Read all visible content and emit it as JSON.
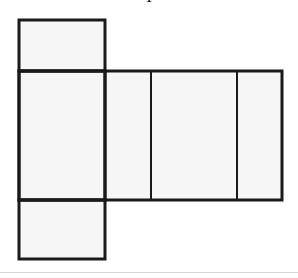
{
  "figure": {
    "kind": "net-diagram",
    "top_label": "I",
    "background_color": "#ffffff",
    "face_fill_color": "#f6f6f6",
    "stroke_color": "#1a1a1a",
    "stroke_width": 3,
    "divider_stroke_width": 2,
    "rule_color": "#d8d8d8",
    "canvas": {
      "width": 298,
      "height": 278
    },
    "grid": {
      "x_left": 19,
      "x_column_right": 105,
      "x_divider_1": 151,
      "x_divider_2": 237,
      "x_right": 282,
      "y_top": 20,
      "y_mid_top": 71,
      "y_mid_bottom": 200,
      "y_bottom": 259,
      "y_rule": 272
    },
    "faces": [
      {
        "name": "top-flap",
        "x": 19,
        "y": 20,
        "width": 86,
        "height": 51
      },
      {
        "name": "left-face",
        "x": 19,
        "y": 71,
        "width": 86,
        "height": 129
      },
      {
        "name": "front-face",
        "x": 105,
        "y": 71,
        "width": 46,
        "height": 129
      },
      {
        "name": "right-face",
        "x": 151,
        "y": 71,
        "width": 86,
        "height": 129
      },
      {
        "name": "back-face",
        "x": 237,
        "y": 71,
        "width": 45,
        "height": 129
      },
      {
        "name": "bottom-flap",
        "x": 19,
        "y": 200,
        "width": 86,
        "height": 59
      }
    ]
  }
}
